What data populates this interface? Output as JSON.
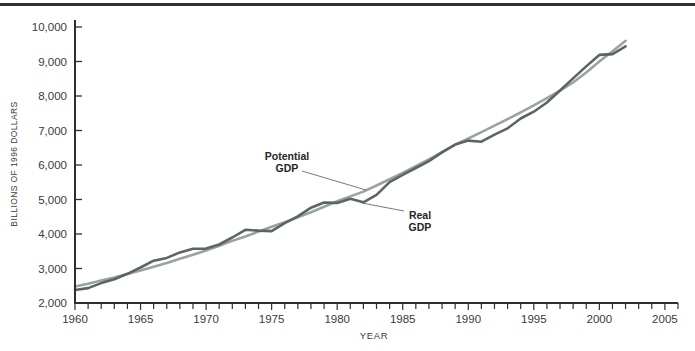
{
  "chart_data": {
    "type": "line",
    "title": "",
    "xlabel": "YEAR",
    "ylabel": "BILLIONS OF 1996 DOLLARS",
    "xlim": [
      1960,
      2006
    ],
    "ylim": [
      2000,
      10000
    ],
    "grid": false,
    "legend": "inline annotations with callout lines",
    "x_tick_labels": [
      "1960",
      "1965",
      "1970",
      "1975",
      "1980",
      "1985",
      "1990",
      "1995",
      "2000",
      "2005"
    ],
    "x_major_ticks": [
      1960,
      1965,
      1970,
      1975,
      1980,
      1985,
      1990,
      1995,
      2000,
      2005
    ],
    "x_minor_tick_step": 1,
    "y_ticks": [
      2000,
      3000,
      4000,
      5000,
      6000,
      7000,
      8000,
      9000,
      10000
    ],
    "y_tick_labels": [
      "2,000",
      "3,000",
      "4,000",
      "5,000",
      "6,000",
      "7,000",
      "8,000",
      "9,000",
      "10,000"
    ],
    "x": [
      1960,
      1961,
      1962,
      1963,
      1964,
      1965,
      1966,
      1967,
      1968,
      1969,
      1970,
      1971,
      1972,
      1973,
      1974,
      1975,
      1976,
      1977,
      1978,
      1979,
      1980,
      1981,
      1982,
      1983,
      1984,
      1985,
      1986,
      1987,
      1988,
      1989,
      1990,
      1991,
      1992,
      1993,
      1994,
      1995,
      1996,
      1997,
      1998,
      1999,
      2000,
      2001,
      2002
    ],
    "series": [
      {
        "name": "Potential GDP",
        "color": "#9ba39d",
        "values": [
          2480,
          2560,
          2650,
          2740,
          2840,
          2940,
          3050,
          3160,
          3280,
          3400,
          3520,
          3660,
          3800,
          3930,
          4070,
          4210,
          4340,
          4480,
          4630,
          4790,
          4950,
          5090,
          5230,
          5405,
          5585,
          5770,
          5965,
          6165,
          6370,
          6590,
          6768,
          6950,
          7138,
          7330,
          7528,
          7731,
          7940,
          8155,
          8390,
          8680,
          9000,
          9300,
          9600
        ]
      },
      {
        "name": "Real GDP",
        "color": "#5a646a",
        "values": [
          2377,
          2432,
          2578,
          2690,
          2847,
          3028,
          3227,
          3308,
          3466,
          3571,
          3578,
          3697,
          3898,
          4123,
          4099,
          4084,
          4312,
          4511,
          4761,
          4912,
          4901,
          5021,
          4919,
          5132,
          5505,
          5717,
          5912,
          6113,
          6368,
          6592,
          6708,
          6676,
          6880,
          7063,
          7348,
          7544,
          7813,
          8160,
          8509,
          8859,
          9191,
          9215,
          9440
        ]
      }
    ],
    "annotations": [
      {
        "name": "potential-gdp",
        "label": "Potential GDP",
        "line1": "Potential",
        "line2": "GDP",
        "label_center_px": {
          "x": 287,
          "y": 162
        },
        "callout_px": {
          "x1": 302,
          "y1": 171,
          "x2": 366,
          "y2": 190
        }
      },
      {
        "name": "real-gdp",
        "label": "Real GDP",
        "line1": "Real",
        "line2": "GDP",
        "label_center_px": {
          "x": 420,
          "y": 221
        },
        "callout_px": {
          "x1": 404,
          "y1": 211,
          "x2": 362,
          "y2": 203
        }
      }
    ],
    "plot_px": {
      "left": 75,
      "right": 678,
      "bottom": 303,
      "top": 27,
      "axis_top": 20
    },
    "colors": {
      "axis": "#2e2e2e",
      "tick_text": "#3a3a3a",
      "annotation_text": "#262626",
      "callout": "#6a6a6a",
      "top_rule": "#333333",
      "background": "#ffffff"
    }
  }
}
